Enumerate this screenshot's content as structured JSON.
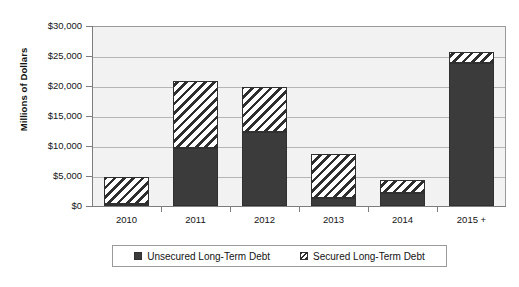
{
  "chart_data": {
    "type": "bar",
    "title": "",
    "subtitle": "",
    "xlabel": "",
    "ylabel": "Millions of Dollars",
    "categories": [
      "2010",
      "2011",
      "2012",
      "2013",
      "2014",
      "2015 +"
    ],
    "ylim": [
      0,
      30000
    ],
    "ytick_values": [
      0,
      5000,
      10000,
      15000,
      20000,
      25000,
      30000
    ],
    "ytick_labels": [
      "$0",
      "$5,000",
      "$10,000",
      "$15,000",
      "$20,000",
      "$25,000",
      "$30,000"
    ],
    "grid": true,
    "stacked": true,
    "legend_position": "bottom",
    "series": [
      {
        "name": "Unsecured Long-Term Debt",
        "fill": "solid-dark",
        "color": "#3b3b3b",
        "values": [
          400,
          9600,
          12400,
          1350,
          2200,
          23800
        ]
      },
      {
        "name": "Secured Long-Term Debt",
        "fill": "diagonal-hatch",
        "color": "#ffffff",
        "values": [
          4450,
          11300,
          7400,
          7380,
          2140,
          1800
        ]
      }
    ],
    "totals": [
      4850,
      20900,
      19800,
      8730,
      4340,
      25600
    ],
    "annotations": []
  },
  "legend": {
    "items": [
      {
        "label": "Unsecured Long-Term Debt",
        "swatch": "solid-dark-swatch"
      },
      {
        "label": "Secured Long-Term Debt",
        "swatch": "hatch-swatch"
      }
    ]
  },
  "axes": {
    "y_title": "Millions of Dollars"
  }
}
